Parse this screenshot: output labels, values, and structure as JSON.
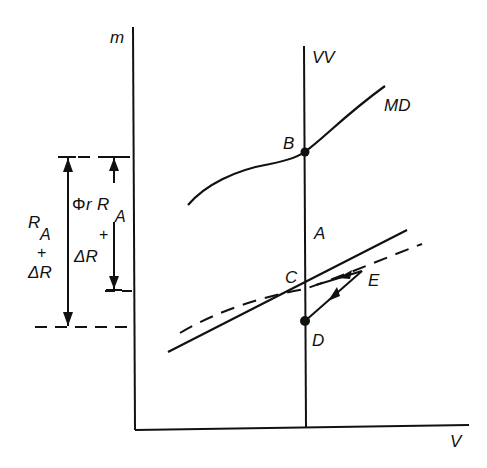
{
  "diagram": {
    "type": "economic-flow-diagram",
    "axes": {
      "y_label": "m",
      "x_label": "V"
    },
    "curves": {
      "vertical_line_label": "VV",
      "upper_curve_label": "MD"
    },
    "points": {
      "B": "B",
      "A": "A",
      "C": "C",
      "D": "D",
      "E": "E"
    },
    "annotations": {
      "left_outer": {
        "line1": "R",
        "line1_sub": "A",
        "plus": "+",
        "line2": "ΔR"
      },
      "left_inner": {
        "phi": "Φ",
        "r": "r",
        "R": "R",
        "sub": "A",
        "plus": "+",
        "delta_r": "ΔR"
      }
    },
    "colors": {
      "ink": "#111111",
      "background": "#ffffff"
    }
  }
}
